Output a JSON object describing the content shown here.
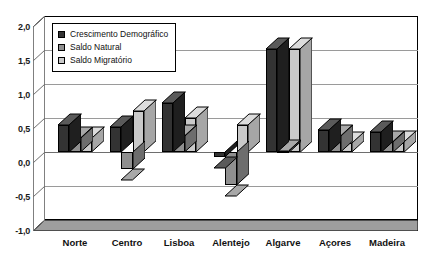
{
  "chart_data": {
    "type": "bar",
    "title": "",
    "subtitle": "",
    "xlabel": "",
    "ylabel": "",
    "ylim": [
      -1.0,
      2.0
    ],
    "y_ticks": [
      2.0,
      1.5,
      1.0,
      0.5,
      0.0,
      -0.5,
      -1.0
    ],
    "y_tick_labels": [
      "2,0",
      "1,5",
      "1,0",
      "0,5",
      "0,0",
      "-0,5",
      "-1,0"
    ],
    "grid": true,
    "legend_position": "upper-left-inside",
    "three_d": true,
    "categories": [
      "Norte",
      "Centro",
      "Lisboa",
      "Alentejo",
      "Algarve",
      "Açores",
      "Madeira"
    ],
    "series": [
      {
        "name": "Crescimento Demográfico",
        "color": "#333333",
        "values": [
          0.4,
          0.37,
          0.72,
          -0.07,
          1.52,
          0.33,
          0.3
        ]
      },
      {
        "name": "Saldo Natural",
        "color": "#8f8f8f",
        "values": [
          0.2,
          -0.25,
          0.23,
          -0.48,
          0.02,
          0.23,
          0.15
        ]
      },
      {
        "name": "Saldo Migratório",
        "color": "#c9c9c9",
        "values": [
          0.2,
          0.6,
          0.5,
          0.4,
          1.52,
          0.13,
          0.15
        ]
      }
    ]
  },
  "legend": {
    "items": [
      {
        "label": "Crescimento Demográfico",
        "swatch": "legend-swatch-dark"
      },
      {
        "label": "Saldo Natural",
        "swatch": "legend-swatch-medium"
      },
      {
        "label": "Saldo Migratório",
        "swatch": "legend-swatch-light"
      }
    ]
  },
  "axes": {
    "y_tick_labels": [
      "2,0",
      "1,5",
      "1,0",
      "0,5",
      "0,0",
      "-0,5",
      "-1,0"
    ],
    "x_tick_labels": [
      "Norte",
      "Centro",
      "Lisboa",
      "Alentejo",
      "Algarve",
      "Açores",
      "Madeira"
    ]
  },
  "colors": {
    "series_dark": "#333333",
    "series_medium": "#8f8f8f",
    "series_light": "#c9c9c9",
    "gridline": "#9a9a9a",
    "axis": "#000000",
    "floor": "#9e9e9e",
    "background": "#ffffff"
  }
}
